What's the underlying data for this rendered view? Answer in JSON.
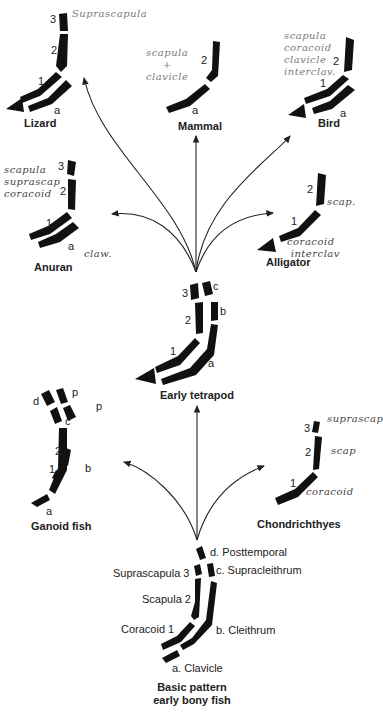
{
  "figure": {
    "colors": {
      "bone": "#111111",
      "arrow": "#222222",
      "text": "#222222",
      "handwriting": "#7a7a7a"
    }
  },
  "organisms": {
    "lizard": {
      "name": "Lizard",
      "numbers": [
        "3",
        "2",
        "1"
      ],
      "letters": [
        "a"
      ],
      "note": "Suprascapula"
    },
    "mammal": {
      "name": "Mammal",
      "numbers": [
        "2"
      ],
      "letters": [
        "a"
      ],
      "note": "scapula\n+\nclavicle"
    },
    "bird": {
      "name": "Bird",
      "numbers": [
        "2",
        "1"
      ],
      "letters": [
        "a"
      ],
      "note": "scapula\ncoracoid\nclavicle\ninterclav."
    },
    "anuran": {
      "name": "Anuran",
      "numbers": [
        "3",
        "2",
        "1"
      ],
      "letters": [
        "a"
      ],
      "note": "scapula\nsuprascap\ncoracoid",
      "note2": "claw."
    },
    "alligator": {
      "name": "Alligator",
      "numbers": [
        "2",
        "1"
      ],
      "note": "scap.",
      "note2": "coracoid\n interclav"
    },
    "early_tetrapod": {
      "name": "Early tetrapod",
      "numbers": [
        "3",
        "2",
        "1"
      ],
      "letters": [
        "c",
        "b",
        "a"
      ]
    },
    "ganoid_fish": {
      "name": "Ganoid fish",
      "numbers": [
        "2",
        "1"
      ],
      "letters": [
        "d",
        "p",
        "c",
        "p",
        "b",
        "a"
      ]
    },
    "chondrichthyes": {
      "name": "Chondrichthyes",
      "numbers": [
        "3",
        "2",
        "1"
      ],
      "note": "suprascap",
      "note2": "scap",
      "note3": "coracoid"
    },
    "basic_pattern": {
      "name_line1": "Basic pattern",
      "name_line2": "early bony fish",
      "left_labels": [
        "Suprascapula 3",
        "Scapula 2",
        "Coracoid 1"
      ],
      "right_labels": [
        "d. Posttemporal",
        "c. Supracleithrum",
        "b. Cleithrum",
        "a. Clavicle"
      ]
    }
  }
}
